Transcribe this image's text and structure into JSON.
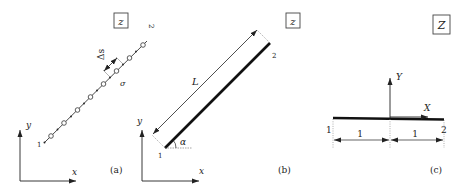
{
  "figure": {
    "panels": [
      {
        "id": "a",
        "caption": "(a)",
        "box_label": "z",
        "axes": {
          "x_label": "x",
          "y_label": "y"
        },
        "end_labels": {
          "start": "1",
          "end": "2"
        },
        "spacing_label": "Δs",
        "element_label": "σ",
        "description": "Discretized line of boundary elements with nodes"
      },
      {
        "id": "b",
        "caption": "(b)",
        "box_label": "z",
        "axes": {
          "x_label": "x",
          "y_label": "y"
        },
        "end_labels": {
          "start": "1",
          "end": "2"
        },
        "length_label": "L",
        "angle_label": "α",
        "description": "Single straight element of length L at angle α"
      },
      {
        "id": "c",
        "caption": "(c)",
        "box_label": "Z",
        "axes": {
          "x_label": "X",
          "y_label": "Y"
        },
        "end_labels": {
          "start": "1",
          "end": "2"
        },
        "half_length_labels": [
          "1",
          "1"
        ],
        "description": "Element in local normalized coordinates"
      }
    ]
  }
}
